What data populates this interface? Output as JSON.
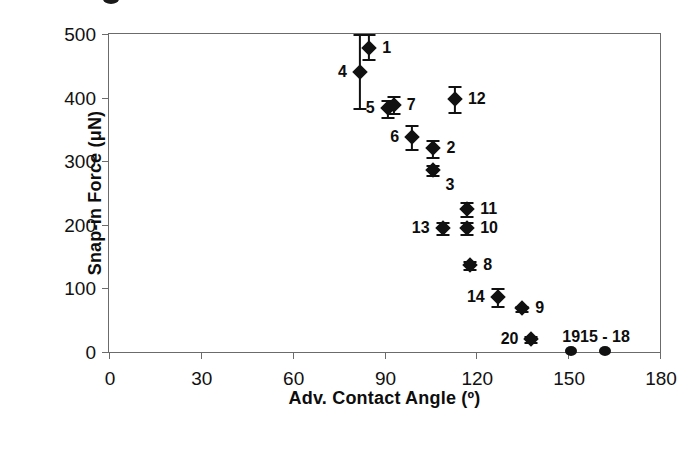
{
  "chart_data": {
    "type": "scatter",
    "title": "",
    "xlabel": "Adv. Contact Angle (º)",
    "ylabel": "Snap-in Force (μN)",
    "xlim": [
      0,
      180
    ],
    "ylim": [
      0,
      500
    ],
    "xticks": [
      "0",
      "30",
      "60",
      "90",
      "120",
      "150",
      "180"
    ],
    "yticks": [
      "0",
      "100",
      "200",
      "300",
      "400",
      "500"
    ],
    "grid": false,
    "legend": "none",
    "marker_color": "#111111",
    "axis_color": "#6b6b6b",
    "points": [
      {
        "label": "4",
        "x": 82,
        "y": 441,
        "err_low": 58,
        "err_high": 59,
        "label_pos": "left"
      },
      {
        "label": "1",
        "x": 85,
        "y": 478,
        "err_low": 17,
        "err_high": 22,
        "label_pos": "right"
      },
      {
        "label": "5",
        "x": 91,
        "y": 383,
        "err_low": 14,
        "err_high": 14,
        "label_pos": "left"
      },
      {
        "label": "7",
        "x": 93,
        "y": 389,
        "err_low": 14,
        "err_high": 14,
        "label_pos": "right"
      },
      {
        "label": "12",
        "x": 113,
        "y": 398,
        "err_low": 20,
        "err_high": 20,
        "label_pos": "right"
      },
      {
        "label": "6",
        "x": 99,
        "y": 338,
        "err_low": 19,
        "err_high": 19,
        "label_pos": "left"
      },
      {
        "label": "2",
        "x": 106,
        "y": 320,
        "err_low": 14,
        "err_high": 14,
        "label_pos": "right"
      },
      {
        "label": "3",
        "x": 106,
        "y": 286,
        "err_low": 8,
        "err_high": 8,
        "label_pos": "right-below"
      },
      {
        "label": "11",
        "x": 117,
        "y": 225,
        "err_low": 11,
        "err_high": 11,
        "label_pos": "right"
      },
      {
        "label": "10",
        "x": 117,
        "y": 195,
        "err_low": 10,
        "err_high": 10,
        "label_pos": "right"
      },
      {
        "label": "13",
        "x": 109,
        "y": 195,
        "err_low": 10,
        "err_high": 10,
        "label_pos": "left"
      },
      {
        "label": "8",
        "x": 118,
        "y": 137,
        "err_low": 6,
        "err_high": 6,
        "label_pos": "right"
      },
      {
        "label": "14",
        "x": 127,
        "y": 86,
        "err_low": 14,
        "err_high": 14,
        "label_pos": "left"
      },
      {
        "label": "9",
        "x": 135,
        "y": 69,
        "err_low": 4,
        "err_high": 4,
        "label_pos": "right"
      },
      {
        "label": "20",
        "x": 138,
        "y": 20,
        "err_low": 5,
        "err_high": 5,
        "label_pos": "left"
      },
      {
        "label": "19",
        "x": 151,
        "y": 2,
        "err_low": 0,
        "err_high": 0,
        "label_pos": "above"
      },
      {
        "label": "15 - 18",
        "x": 162,
        "y": 2,
        "err_low": 0,
        "err_high": 0,
        "label_pos": "above"
      }
    ]
  }
}
